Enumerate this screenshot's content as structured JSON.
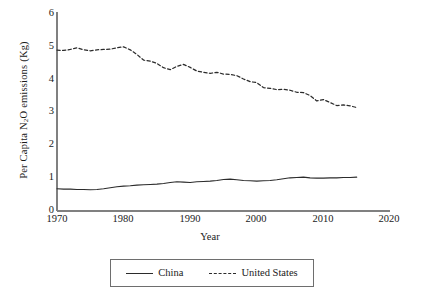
{
  "chart_data": {
    "type": "line",
    "title": "",
    "xlabel": "Year",
    "ylabel": "Per Capita N2O emissions (Kg)",
    "ylabel_parts": {
      "pre": "Per Capita N",
      "sub": "2",
      "post": "O emissions (Kg)"
    },
    "xlim": [
      1970,
      2020
    ],
    "ylim": [
      0,
      6
    ],
    "xticks": [
      1970,
      1980,
      1990,
      2000,
      2010,
      2020
    ],
    "yticks": [
      0,
      1,
      2,
      3,
      4,
      5,
      6
    ],
    "grid": false,
    "legend_position": "bottom-center",
    "axis_color": "#808080",
    "series_color": "#2b2b2b",
    "x": [
      1970,
      1971,
      1972,
      1973,
      1974,
      1975,
      1976,
      1977,
      1978,
      1979,
      1980,
      1981,
      1982,
      1983,
      1984,
      1985,
      1986,
      1987,
      1988,
      1989,
      1990,
      1991,
      1992,
      1993,
      1994,
      1995,
      1996,
      1997,
      1998,
      1999,
      2000,
      2001,
      2002,
      2003,
      2004,
      2005,
      2006,
      2007,
      2008,
      2009,
      2010,
      2011,
      2012,
      2013,
      2014,
      2015
    ],
    "series": [
      {
        "name": "China",
        "style": "solid",
        "values": [
          0.67,
          0.66,
          0.66,
          0.65,
          0.65,
          0.64,
          0.65,
          0.67,
          0.7,
          0.73,
          0.75,
          0.76,
          0.78,
          0.79,
          0.8,
          0.81,
          0.83,
          0.86,
          0.88,
          0.87,
          0.86,
          0.88,
          0.89,
          0.9,
          0.92,
          0.95,
          0.96,
          0.94,
          0.92,
          0.91,
          0.9,
          0.91,
          0.92,
          0.94,
          0.97,
          1.0,
          1.01,
          1.02,
          1.0,
          0.99,
          0.99,
          1.0,
          1.0,
          1.01,
          1.01,
          1.02
        ]
      },
      {
        "name": "United States",
        "style": "dashed",
        "values": [
          4.85,
          4.84,
          4.87,
          4.92,
          4.86,
          4.83,
          4.86,
          4.87,
          4.88,
          4.92,
          4.95,
          4.86,
          4.72,
          4.55,
          4.52,
          4.45,
          4.32,
          4.26,
          4.36,
          4.42,
          4.33,
          4.22,
          4.18,
          4.15,
          4.18,
          4.13,
          4.12,
          4.08,
          3.98,
          3.9,
          3.87,
          3.72,
          3.7,
          3.66,
          3.67,
          3.64,
          3.58,
          3.57,
          3.48,
          3.32,
          3.36,
          3.27,
          3.18,
          3.2,
          3.17,
          3.12
        ]
      }
    ]
  },
  "legend": {
    "items": [
      {
        "label": "China",
        "style": "solid"
      },
      {
        "label": "United States",
        "style": "dashed"
      }
    ]
  },
  "axis": {
    "y_tick_labels": [
      "6",
      "5",
      "4",
      "3",
      "2",
      "1",
      "0"
    ],
    "x_tick_labels": [
      "1970",
      "1980",
      "1990",
      "2000",
      "2010",
      "2020"
    ]
  }
}
